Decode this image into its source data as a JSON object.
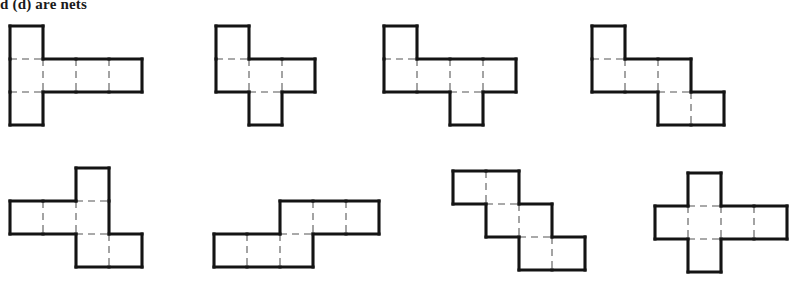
{
  "figure": {
    "caption": "d (d) are nets",
    "background_color": "#ffffff",
    "outline_color": "#141414",
    "fold_line_color": "#8d8d8d",
    "cell_size_px": 33,
    "net_count": 8
  },
  "nets": [
    {
      "id": "net-1",
      "label": "net-1-t-shape",
      "origin_x": 10,
      "origin_y": 26,
      "cells": [
        [
          0,
          0
        ],
        [
          0,
          1
        ],
        [
          0,
          2
        ],
        [
          1,
          1
        ],
        [
          2,
          1
        ],
        [
          3,
          1
        ]
      ],
      "cols": 4,
      "rows": 3
    },
    {
      "id": "net-2",
      "label": "net-2-z-offset",
      "origin_x": 216,
      "origin_y": 26,
      "cells": [
        [
          0,
          0
        ],
        [
          0,
          1
        ],
        [
          1,
          1
        ],
        [
          2,
          1
        ],
        [
          1,
          2
        ]
      ],
      "cols": 3,
      "rows": 3
    },
    {
      "id": "net-3",
      "label": "net-3-offset-row-four",
      "origin_x": 384,
      "origin_y": 26,
      "cells": [
        [
          0,
          0
        ],
        [
          0,
          1
        ],
        [
          1,
          1
        ],
        [
          2,
          1
        ],
        [
          3,
          1
        ],
        [
          2,
          2
        ]
      ],
      "cols": 4,
      "rows": 3
    },
    {
      "id": "net-4",
      "label": "net-4-staircase",
      "origin_x": 592,
      "origin_y": 26,
      "cells": [
        [
          0,
          0
        ],
        [
          0,
          1
        ],
        [
          1,
          1
        ],
        [
          2,
          1
        ],
        [
          2,
          2
        ],
        [
          3,
          2
        ]
      ],
      "cols": 4,
      "rows": 3
    },
    {
      "id": "net-5",
      "label": "net-5-cross-offset",
      "origin_x": 10,
      "origin_y": 168,
      "cells": [
        [
          2,
          0
        ],
        [
          0,
          1
        ],
        [
          1,
          1
        ],
        [
          2,
          1
        ],
        [
          2,
          2
        ],
        [
          3,
          2
        ]
      ],
      "cols": 4,
      "rows": 3
    },
    {
      "id": "net-6",
      "label": "net-6-s-shape",
      "origin_x": 214,
      "origin_y": 201,
      "cells": [
        [
          2,
          0
        ],
        [
          3,
          0
        ],
        [
          4,
          0
        ],
        [
          0,
          1
        ],
        [
          1,
          1
        ],
        [
          2,
          1
        ]
      ],
      "cols": 5,
      "rows": 2
    },
    {
      "id": "net-7",
      "label": "net-7-descending-stair",
      "origin_x": 453,
      "origin_y": 171,
      "cells": [
        [
          0,
          0
        ],
        [
          1,
          0
        ],
        [
          1,
          1
        ],
        [
          2,
          1
        ],
        [
          2,
          2
        ],
        [
          3,
          2
        ]
      ],
      "cols": 4,
      "rows": 3
    },
    {
      "id": "net-8",
      "label": "net-8-plus-shape",
      "origin_x": 655,
      "origin_y": 173,
      "cells": [
        [
          1,
          0
        ],
        [
          0,
          1
        ],
        [
          1,
          1
        ],
        [
          2,
          1
        ],
        [
          3,
          1
        ],
        [
          1,
          2
        ]
      ],
      "cols": 4,
      "rows": 3
    }
  ]
}
